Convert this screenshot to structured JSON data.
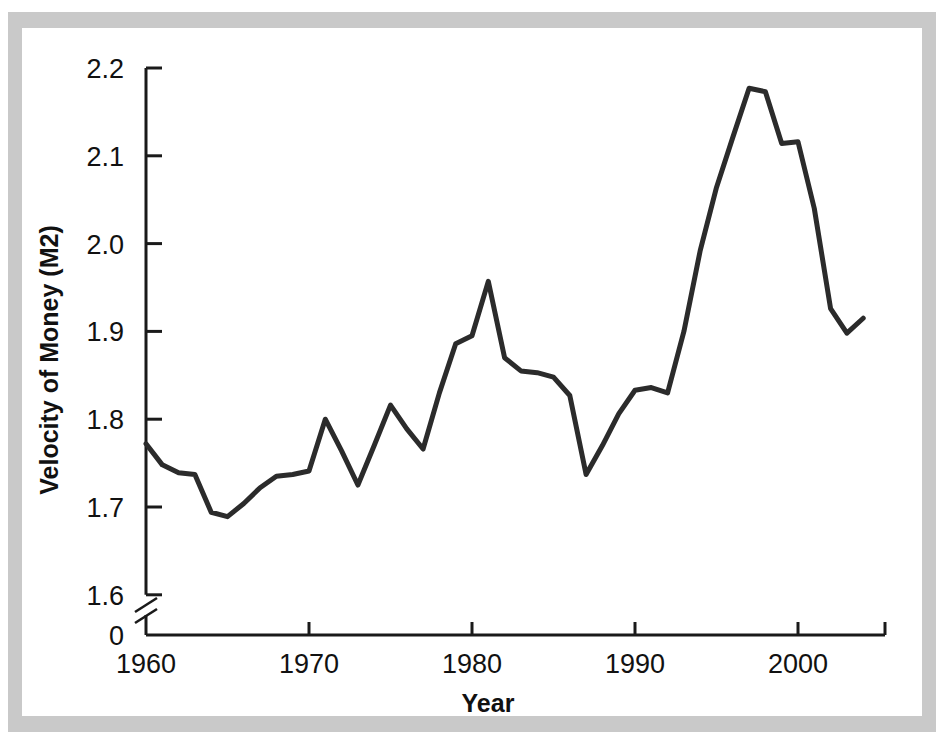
{
  "figure": {
    "background": "#ffffff",
    "mount_color": "#c9c9c9",
    "line_color": "#2b2b2b",
    "axis_color": "#1a1a1a",
    "axis_break_label": "0"
  },
  "chart_data": {
    "type": "line",
    "title": "",
    "xlabel": "Year",
    "ylabel": "Velocity of Money (M2)",
    "xlim": [
      1960,
      2005
    ],
    "ylim": [
      1.6,
      2.2
    ],
    "grid": false,
    "legend": null,
    "y_axis_break": true,
    "y_axis_break_note": "axis broken between 0 and 1.6",
    "xticks": [
      1960,
      1970,
      1980,
      1990,
      2000
    ],
    "xtick_labels": [
      "1960",
      "1970",
      "1980",
      "1990",
      "2000"
    ],
    "yticks": [
      1.6,
      1.7,
      1.8,
      1.9,
      2.0,
      2.1,
      2.2
    ],
    "ytick_labels": [
      "1.6",
      "1.7",
      "1.8",
      "1.9",
      "2.0",
      "2.1",
      "2.2"
    ],
    "zero_tick_label": "0",
    "x": [
      1960,
      1961,
      1962,
      1963,
      1964,
      1965,
      1966,
      1967,
      1968,
      1969,
      1970,
      1971,
      1972,
      1973,
      1974,
      1975,
      1976,
      1977,
      1978,
      1979,
      1980,
      1981,
      1982,
      1983,
      1984,
      1985,
      1986,
      1987,
      1988,
      1989,
      1990,
      1991,
      1992,
      1993,
      1994,
      1995,
      1996,
      1997,
      1998,
      1999,
      2000,
      2001,
      2002,
      2003
    ],
    "values": [
      1.772,
      1.748,
      1.739,
      1.737,
      1.694,
      1.689,
      1.704,
      1.722,
      1.735,
      1.737,
      1.741,
      1.8,
      1.764,
      1.725,
      1.77,
      1.816,
      1.789,
      1.766,
      1.83,
      1.886,
      1.895,
      1.957,
      1.87,
      1.855,
      1.853,
      1.848,
      1.827,
      1.737,
      1.77,
      1.806,
      1.833,
      1.836,
      1.83,
      1.9,
      1.992,
      2.064,
      2.121,
      2.177,
      2.173,
      2.114,
      2.116,
      2.04,
      1.926,
      1.898
    ],
    "last_value": 1.915,
    "series_name": "Velocity of Money (M2)"
  }
}
